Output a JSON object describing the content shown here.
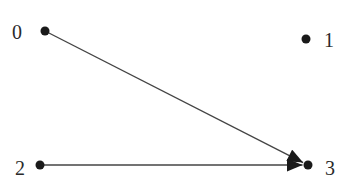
{
  "diagram": {
    "type": "directed-graph",
    "colors": {
      "node": "#1a1a1a",
      "edge": "#444444",
      "label": "#2a2a2a",
      "background": "#ffffff"
    },
    "nodes": [
      {
        "id": "0",
        "label": "0",
        "x": 45,
        "y": 31,
        "label_x": 12,
        "label_y": 22
      },
      {
        "id": "1",
        "label": "1",
        "x": 306,
        "y": 39,
        "label_x": 324,
        "label_y": 30
      },
      {
        "id": "2",
        "label": "2",
        "x": 40,
        "y": 165,
        "label_x": 15,
        "label_y": 158
      },
      {
        "id": "3",
        "label": "3",
        "x": 308,
        "y": 165,
        "label_x": 325,
        "label_y": 158
      }
    ],
    "edges": [
      {
        "from": "0",
        "to": "3",
        "directed": true
      },
      {
        "from": "2",
        "to": "3",
        "directed": true
      }
    ]
  }
}
